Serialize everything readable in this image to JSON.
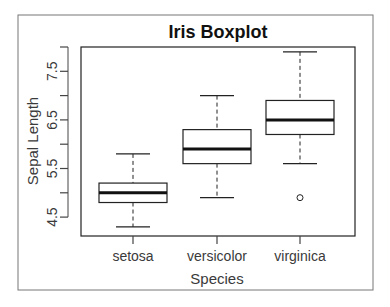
{
  "chart_data": {
    "type": "boxplot",
    "title": "Iris Boxplot",
    "xlabel": "Species",
    "ylabel": "Sepal Length",
    "categories": [
      "setosa",
      "versicolor",
      "virginica"
    ],
    "y_ticks": [
      4.5,
      5.0,
      5.5,
      6.0,
      6.5,
      7.0,
      7.5,
      8.0
    ],
    "y_tick_labels": [
      "4.5",
      "5.5",
      "6.5",
      "7.5"
    ],
    "ylim": [
      4.2,
      8.0
    ],
    "grid": false,
    "series": [
      {
        "name": "setosa",
        "whisker_low": 4.3,
        "q1": 4.8,
        "median": 5.0,
        "q3": 5.2,
        "whisker_high": 5.8,
        "outliers": []
      },
      {
        "name": "versicolor",
        "whisker_low": 4.9,
        "q1": 5.6,
        "median": 5.9,
        "q3": 6.3,
        "whisker_high": 7.0,
        "outliers": []
      },
      {
        "name": "virginica",
        "whisker_low": 5.6,
        "q1": 6.2,
        "median": 6.5,
        "q3": 6.9,
        "whisker_high": 7.9,
        "outliers": [
          4.9
        ]
      }
    ]
  }
}
